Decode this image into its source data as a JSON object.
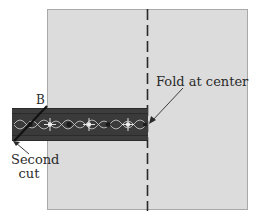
{
  "diagram": {
    "labels": {
      "fold": "Fold at center",
      "point_b": "B",
      "second_cut_line1": "Second",
      "second_cut_line2": "cut"
    },
    "colors": {
      "fabric_square": "#dcdcdc",
      "fabric_border": "#a8a8a8",
      "ribbon_dark": "#2b2b2b",
      "ribbon_pattern": "#d9d9d9",
      "fold_line": "#2a2a2a"
    },
    "elements": [
      "fabric square",
      "vertical dashed fold line",
      "decorative ribbon/trim strip",
      "diagonal cut at left end"
    ]
  }
}
